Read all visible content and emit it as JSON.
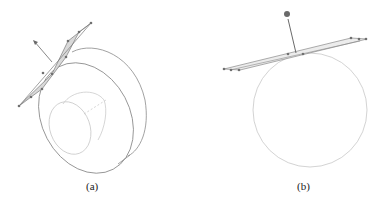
{
  "figure": {
    "panels": [
      {
        "id": "a",
        "caption": "(a)",
        "description": "Hollow cylinder (annular disk) with a tangent plane and normal arrow",
        "colors": {
          "outline": "#8a8a8a",
          "inner": "#c4c4c4",
          "plane_fill": "#d9d9d9",
          "points": "#707070"
        }
      },
      {
        "id": "b",
        "caption": "(b)",
        "description": "Circle with a tangent plane strip and normal vector ending in a sphere",
        "colors": {
          "outline": "#c8c8c8",
          "plane": "#8a8a8a",
          "sphere": "#6a6a6a"
        }
      }
    ]
  }
}
